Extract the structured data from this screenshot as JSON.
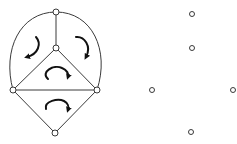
{
  "diagram": {
    "title": "",
    "colors": {
      "edge": "#3a3a3a",
      "node_fill": "#ffffff",
      "arrow": "#111111",
      "background": "#ffffff"
    },
    "left_graph": {
      "nodes": [
        {
          "id": "top",
          "x": 56,
          "y": 12
        },
        {
          "id": "center",
          "x": 56,
          "y": 48
        },
        {
          "id": "left",
          "x": 13,
          "y": 90
        },
        {
          "id": "right",
          "x": 97,
          "y": 90
        },
        {
          "id": "bottom",
          "x": 55,
          "y": 133
        }
      ],
      "edges": [
        {
          "from": "top",
          "to": "center",
          "type": "straight"
        },
        {
          "from": "center",
          "to": "left",
          "type": "straight"
        },
        {
          "from": "center",
          "to": "right",
          "type": "straight"
        },
        {
          "from": "left",
          "to": "right",
          "type": "straight"
        },
        {
          "from": "left",
          "to": "bottom",
          "type": "straight"
        },
        {
          "from": "right",
          "to": "bottom",
          "type": "straight"
        },
        {
          "from": "top",
          "to": "left",
          "type": "curved"
        },
        {
          "from": "top",
          "to": "right",
          "type": "curved"
        }
      ],
      "face_rotations": [
        {
          "face": "upper-left",
          "direction": "counterclockwise",
          "cx": 30,
          "cy": 47
        },
        {
          "face": "upper-right",
          "direction": "clockwise",
          "cx": 82,
          "cy": 47
        },
        {
          "face": "middle-triangle",
          "direction": "clockwise",
          "cx": 56,
          "cy": 74
        },
        {
          "face": "bottom-triangle",
          "direction": "clockwise",
          "cx": 56,
          "cy": 108
        }
      ]
    },
    "right_graph": {
      "nodes": [
        {
          "id": "top",
          "x": 192,
          "y": 14
        },
        {
          "id": "center",
          "x": 192,
          "y": 48
        },
        {
          "id": "left",
          "x": 152,
          "y": 90
        },
        {
          "id": "right",
          "x": 233,
          "y": 90
        },
        {
          "id": "bottom",
          "x": 191,
          "y": 132
        }
      ],
      "edges": []
    }
  }
}
